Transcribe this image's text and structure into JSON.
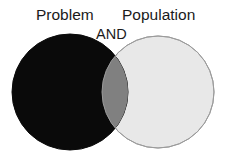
{
  "diagram": {
    "type": "venn",
    "title": "",
    "background_color": "#FFFFFF",
    "width": 232,
    "height": 157,
    "sets": [
      {
        "id": "problem",
        "label": "Problem",
        "fill_color": "#0A0A0A",
        "stroke_color": "#0A0A0A",
        "center_x": 70,
        "center_y": 92,
        "radius": 58
      },
      {
        "id": "population",
        "label": "Population",
        "fill_color": "#E8E8E8",
        "stroke_color": "#9B9B9B",
        "center_x": 158,
        "center_y": 92,
        "radius": 56
      }
    ],
    "intersection": {
      "label": "AND",
      "fill_color": "#808080",
      "stroke_color": "#808080"
    },
    "label_color": "#1A1A1A"
  }
}
